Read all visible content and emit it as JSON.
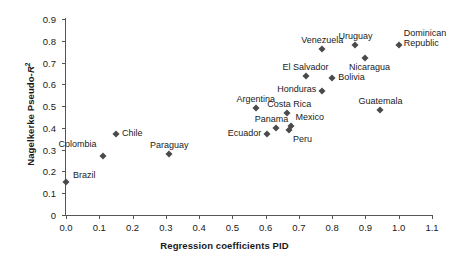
{
  "chart_data": {
    "type": "scatter",
    "title": "",
    "xlabel": "Regression coefficients PID",
    "ylabel": "Nagelkerke Pseudo-R²",
    "xlim": [
      0.0,
      1.1
    ],
    "ylim": [
      0.0,
      0.9
    ],
    "grid": false,
    "legend": false,
    "marker": "diamond",
    "marker_color": "#4a4a4a",
    "xticks": [
      "0.0",
      "0.1",
      "0.2",
      "0.3",
      "0.4",
      "0.5",
      "0.6",
      "0.7",
      "0.8",
      "0.9",
      "1.0",
      "1.1"
    ],
    "xtick_values": [
      0.0,
      0.1,
      0.2,
      0.3,
      0.4,
      0.5,
      0.6,
      0.7,
      0.8,
      0.9,
      1.0,
      1.1
    ],
    "yticks": [
      "0",
      "0.1",
      "0.2",
      "0.3",
      "0.4",
      "0.5",
      "0.6",
      "0.7",
      "0.8",
      "0.9"
    ],
    "ytick_values": [
      0.0,
      0.1,
      0.2,
      0.3,
      0.4,
      0.5,
      0.6,
      0.7,
      0.8,
      0.9
    ],
    "points": [
      {
        "label": "Brazil",
        "x": 0.0,
        "y": 0.15,
        "lpos": "right",
        "dx": 7,
        "dy": -6
      },
      {
        "label": "Colombia",
        "x": 0.11,
        "y": 0.27,
        "lpos": "left",
        "dx": -6,
        "dy": -11
      },
      {
        "label": "Chile",
        "x": 0.15,
        "y": 0.37,
        "lpos": "right",
        "dx": 6,
        "dy": 0
      },
      {
        "label": "Paraguay",
        "x": 0.31,
        "y": 0.28,
        "lpos": "above",
        "dx": 0,
        "dy": -4
      },
      {
        "label": "Argentina",
        "x": 0.57,
        "y": 0.49,
        "lpos": "above",
        "dx": 0,
        "dy": -4
      },
      {
        "label": "Ecuador",
        "x": 0.605,
        "y": 0.37,
        "lpos": "left",
        "dx": -6,
        "dy": 0
      },
      {
        "label": "Panama",
        "x": 0.63,
        "y": 0.4,
        "lpos": "above",
        "dx": -4,
        "dy": -4
      },
      {
        "label": "Costa Rica",
        "x": 0.665,
        "y": 0.47,
        "lpos": "above",
        "dx": 2,
        "dy": -4
      },
      {
        "label": "Peru",
        "x": 0.67,
        "y": 0.39,
        "lpos": "right",
        "dx": 4,
        "dy": 10
      },
      {
        "label": "Mexico",
        "x": 0.675,
        "y": 0.41,
        "lpos": "right",
        "dx": 5,
        "dy": -8
      },
      {
        "label": "El Salvador",
        "x": 0.72,
        "y": 0.64,
        "lpos": "above",
        "dx": 0,
        "dy": -4
      },
      {
        "label": "Honduras",
        "x": 0.77,
        "y": 0.57,
        "lpos": "left",
        "dx": -6,
        "dy": -1
      },
      {
        "label": "Venezuela",
        "x": 0.77,
        "y": 0.76,
        "lpos": "above",
        "dx": 0,
        "dy": -4
      },
      {
        "label": "Bolivia",
        "x": 0.8,
        "y": 0.63,
        "lpos": "right",
        "dx": 6,
        "dy": 0
      },
      {
        "label": "Uruguay",
        "x": 0.87,
        "y": 0.78,
        "lpos": "above",
        "dx": 0,
        "dy": -4
      },
      {
        "label": "Nicaragua",
        "x": 0.9,
        "y": 0.72,
        "lpos": "above",
        "dx": 4,
        "dy": 14
      },
      {
        "label": "Guatemala",
        "x": 0.945,
        "y": 0.48,
        "lpos": "above",
        "dx": 0,
        "dy": -4
      },
      {
        "label": "Dominican Republic",
        "x": 1.0,
        "y": 0.78,
        "lpos": "right",
        "dx": 5,
        "dy": -7,
        "multiline": [
          "Dominican",
          "Republic"
        ]
      }
    ]
  },
  "axes": {
    "xlabel": "Regression coefficients PID",
    "ylabel_prefix": "Nagelkerke Pseudo-",
    "ylabel_symbol": "R",
    "ylabel_sup": "2"
  }
}
